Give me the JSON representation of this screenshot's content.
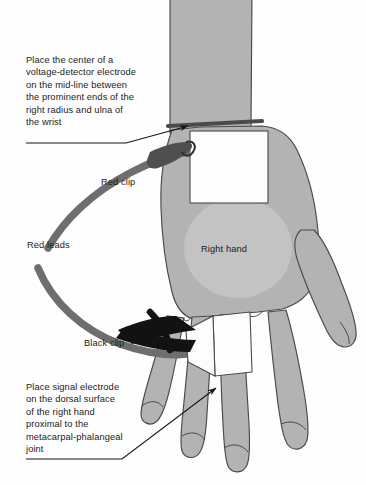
{
  "figure": {
    "background_color": "#fefefe",
    "width": 366,
    "height": 485
  },
  "callouts": [
    {
      "id": "wrist-electrode-instruction",
      "text": "Place the center of a\nvoltage-detector electrode\non the mid-line between\nthe prominent ends of the\nright radius and ulna of\nthe wrist",
      "points_to": "wrist-electrode-patch"
    },
    {
      "id": "hand-electrode-instruction",
      "text": "Place signal electrode\non the dorsal surface\nof the right hand\nproximal to the\nmetacarpal-phalangeal\njoint",
      "points_to": "hand-electrode-patch"
    }
  ],
  "labels": {
    "red_clip": "Red clip",
    "red_leads": "Red leads",
    "black_clip": "Black clip",
    "right_hand": "Right hand"
  },
  "colors": {
    "skin_fill": "#b3b3b3",
    "skin_highlight": "#c6c6c6",
    "skin_shadow": "#a3a3a3",
    "outline": "#4a4a4a",
    "lead_gray": "#6e6e6e",
    "clip_black": "#121212",
    "electrode_white": "#fdfdfd",
    "text": "#1b1b1b",
    "background": "#fefefe"
  },
  "anatomy": {
    "parts": [
      "forearm",
      "wrist",
      "dorsum-of-hand",
      "thumb",
      "index-finger",
      "middle-finger",
      "ring-finger",
      "little-finger"
    ]
  },
  "electrodes": [
    {
      "id": "wrist-electrode-patch",
      "label": "voltage-detector electrode",
      "color": "#fdfdfd"
    },
    {
      "id": "hand-electrode-patch",
      "label": "signal electrode",
      "color": "#fdfdfd"
    }
  ],
  "leads": [
    {
      "id": "red-lead-upper",
      "label": "Red leads",
      "color": "#6e6e6e"
    },
    {
      "id": "red-lead-lower",
      "label": "Red leads",
      "color": "#6e6e6e"
    }
  ]
}
